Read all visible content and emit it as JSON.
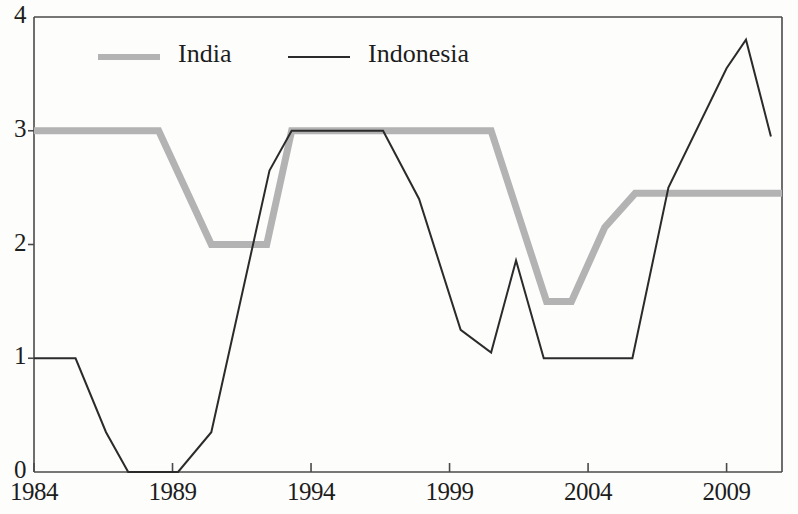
{
  "chart_data": {
    "type": "line",
    "title": "",
    "subtitle": "",
    "xlabel": "",
    "ylabel": "",
    "xlim": [
      1984,
      2011
    ],
    "ylim": [
      0,
      4
    ],
    "grid": false,
    "legend_position": "top-left",
    "y_ticks": [
      "4",
      "3",
      "2",
      "1",
      "0"
    ],
    "y_tick_values": [
      4,
      3,
      2,
      1,
      0
    ],
    "x_ticks": [
      "1984",
      "1989",
      "1994",
      "1999",
      "2004",
      "2009"
    ],
    "x_tick_values": [
      1984,
      1989,
      1994,
      1999,
      2004,
      2009
    ],
    "series": [
      {
        "name": "India",
        "color": "#b3b3b3",
        "style": "thick-gray",
        "linewidth": 7,
        "points": [
          [
            1984.0,
            3.0
          ],
          [
            1988.5,
            3.0
          ],
          [
            1990.4,
            2.0
          ],
          [
            1992.4,
            2.0
          ],
          [
            1993.3,
            3.0
          ],
          [
            2000.5,
            3.0
          ],
          [
            2002.5,
            1.5
          ],
          [
            2003.4,
            1.5
          ],
          [
            2004.6,
            2.15
          ],
          [
            2005.7,
            2.45
          ],
          [
            2011.0,
            2.45
          ]
        ]
      },
      {
        "name": "Indonesia",
        "color": "#2b2b2b",
        "style": "thin-black",
        "linewidth": 2,
        "points": [
          [
            1984.0,
            1.0
          ],
          [
            1985.5,
            1.0
          ],
          [
            1986.6,
            0.35
          ],
          [
            1987.4,
            0.0
          ],
          [
            1989.2,
            0.0
          ],
          [
            1990.4,
            0.35
          ],
          [
            1992.5,
            2.65
          ],
          [
            1993.3,
            3.0
          ],
          [
            1996.6,
            3.0
          ],
          [
            1997.9,
            2.4
          ],
          [
            1999.4,
            1.25
          ],
          [
            2000.5,
            1.05
          ],
          [
            2001.4,
            1.86
          ],
          [
            2002.4,
            1.0
          ],
          [
            2005.6,
            1.0
          ],
          [
            2006.9,
            2.5
          ],
          [
            2009.0,
            3.55
          ],
          [
            2009.7,
            3.8
          ],
          [
            2010.6,
            2.95
          ]
        ]
      }
    ],
    "legend": [
      {
        "label": "India",
        "color": "#b3b3b3",
        "style": "thick-gray"
      },
      {
        "label": "Indonesia",
        "color": "#2b2b2b",
        "style": "thin-black"
      }
    ]
  },
  "colors": {
    "india": "#b3b3b3",
    "indonesia": "#2b2b2b",
    "axis": "#4a4a4a",
    "text": "#1d1d1d",
    "background": "#fdfdfc"
  }
}
